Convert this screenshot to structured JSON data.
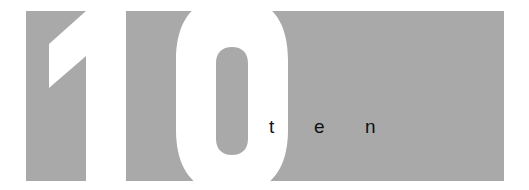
{
  "graphic": {
    "numeral": "10",
    "word_letters": [
      "t",
      "e",
      "n"
    ],
    "colors": {
      "panel": "#a9a9a9",
      "numeral": "#ffffff",
      "background": "#ffffff",
      "text": "#111111"
    }
  }
}
